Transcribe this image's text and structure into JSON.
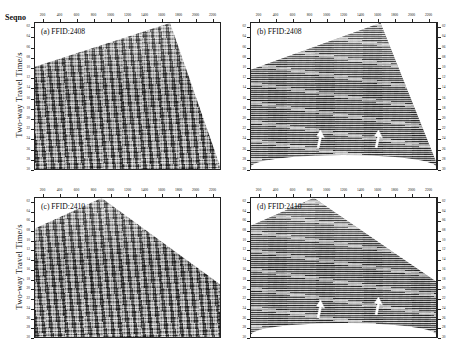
{
  "figure": {
    "seqno_label": "Seqno",
    "ylabel": "Two-way Travel Time/s",
    "background_color": "#ffffff",
    "axis_color": "#222222",
    "data_gray": "#8a8a8a",
    "arrow_color": "#ffffff"
  },
  "axes": {
    "x": {
      "name": "Seqno",
      "ticks": [
        200,
        400,
        600,
        800,
        1000,
        1200,
        1400,
        1600,
        1800,
        2000,
        2200
      ],
      "tick_labels": [
        "200",
        "400",
        "600",
        "800",
        "1000",
        "1200",
        "1400",
        "1600",
        "1800",
        "2000",
        "2200"
      ],
      "min": 100,
      "max": 2300,
      "position": "top"
    },
    "y": {
      "name": "Two-way Travel Time/s",
      "ticks": [
        0.2,
        0.4,
        0.6,
        0.8,
        1.0,
        1.2,
        1.4,
        1.6,
        1.8,
        2.0,
        2.2,
        2.4,
        2.6,
        2.8,
        3.0
      ],
      "tick_labels": [
        "02",
        "04",
        "06",
        "08",
        "10",
        "12",
        "14",
        "16",
        "18",
        "20",
        "22",
        "24",
        "26",
        "28",
        "30"
      ],
      "min": 0.1,
      "max": 3.0,
      "direction": "increasing-downward"
    }
  },
  "panels": [
    {
      "id": "a",
      "title": "(a) FFID:2408",
      "ffid": "2408",
      "column": "left",
      "row": "top",
      "processing": "raw",
      "apex_x_fraction": 0.73,
      "left_top_fraction": 0.3,
      "right_top_fraction": 0.98,
      "arrows": []
    },
    {
      "id": "b",
      "title": "(b) FFID:2408",
      "ffid": "2408",
      "column": "right",
      "row": "top",
      "processing": "denoised",
      "apex_x_fraction": 0.7,
      "left_top_fraction": 0.32,
      "right_top_fraction": 0.95,
      "arrows": [
        {
          "x_fraction": 0.37,
          "y_fraction": 0.8
        },
        {
          "x_fraction": 0.68,
          "y_fraction": 0.8
        }
      ]
    },
    {
      "id": "c",
      "title": "(c) FFID:2410",
      "ffid": "2410",
      "column": "left",
      "row": "bottom",
      "processing": "raw",
      "apex_x_fraction": 0.36,
      "left_top_fraction": 0.22,
      "right_top_fraction": 0.62,
      "arrows": []
    },
    {
      "id": "d",
      "title": "(d) FFID:2410",
      "ffid": "2410",
      "column": "right",
      "row": "bottom",
      "processing": "denoised",
      "apex_x_fraction": 0.34,
      "left_top_fraction": 0.2,
      "right_top_fraction": 0.6,
      "arrows": [
        {
          "x_fraction": 0.37,
          "y_fraction": 0.8
        },
        {
          "x_fraction": 0.68,
          "y_fraction": 0.78
        }
      ]
    }
  ],
  "chart_data": {
    "type": "heatmap",
    "xlabel": "Seqno",
    "ylabel": "Two-way Travel Time/s",
    "xlim": [
      100,
      2300
    ],
    "ylim": [
      0.1,
      3.0
    ],
    "grid": false,
    "legend": "none",
    "x_tick_labels": [
      "200",
      "400",
      "600",
      "800",
      "1000",
      "1200",
      "1400",
      "1600",
      "1800",
      "2000",
      "2200"
    ],
    "y_tick_labels": [
      "02",
      "04",
      "06",
      "08",
      "10",
      "12",
      "14",
      "16",
      "18",
      "20",
      "22",
      "24",
      "26",
      "28",
      "30"
    ],
    "subplots": [
      {
        "label": "(a) FFID:2408",
        "description": "Raw seismic shot gather, FFID 2408, direct-wave wedge apex near Seqno 1700",
        "apex_seqno": 1700,
        "annotations": []
      },
      {
        "label": "(b) FFID:2408",
        "description": "Denoised seismic shot gather, FFID 2408, two white arrows mark recovered reflection events",
        "apex_seqno": 1640,
        "annotations": [
          {
            "type": "arrow",
            "seqno": 920,
            "time_s": 2.45
          },
          {
            "type": "arrow",
            "seqno": 1600,
            "time_s": 2.45
          }
        ]
      },
      {
        "label": "(c) FFID:2410",
        "description": "Raw seismic shot gather, FFID 2410, direct-wave wedge apex near Seqno 900",
        "apex_seqno": 900,
        "annotations": []
      },
      {
        "label": "(d) FFID:2410",
        "description": "Denoised seismic shot gather, FFID 2410, two white arrows mark recovered reflection events",
        "apex_seqno": 860,
        "annotations": [
          {
            "type": "arrow",
            "seqno": 920,
            "time_s": 2.45
          },
          {
            "type": "arrow",
            "seqno": 1600,
            "time_s": 2.4
          }
        ]
      }
    ]
  }
}
